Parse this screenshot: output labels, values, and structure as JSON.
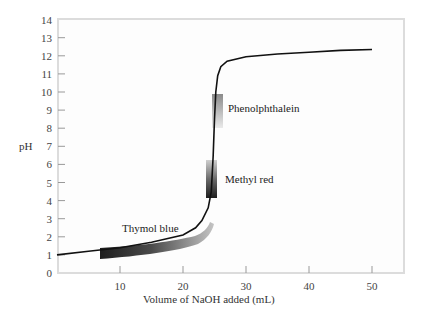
{
  "chart_data": {
    "type": "line",
    "title": "",
    "xlabel": "Volume of NaOH added (mL)",
    "ylabel": "pH",
    "xlim": [
      0,
      55
    ],
    "ylim": [
      0,
      14
    ],
    "xticks": [
      10,
      20,
      30,
      40,
      50
    ],
    "yticks": [
      0,
      1,
      2,
      3,
      4,
      5,
      6,
      7,
      8,
      9,
      10,
      11,
      12,
      13,
      14
    ],
    "grid": false,
    "legend": null,
    "series": [
      {
        "name": "Titration curve",
        "x": [
          0,
          5,
          10,
          15,
          20,
          22,
          23,
          24,
          24.5,
          24.8,
          25,
          25.2,
          25.5,
          26,
          27,
          30,
          35,
          40,
          45,
          50
        ],
        "y": [
          1.0,
          1.2,
          1.4,
          1.7,
          2.1,
          2.5,
          2.9,
          3.6,
          4.5,
          6.5,
          8.5,
          10.0,
          10.9,
          11.4,
          11.7,
          11.95,
          12.1,
          12.2,
          12.3,
          12.35
        ]
      }
    ],
    "annotations": [
      {
        "text": "Thymol blue",
        "indicator_range_x": [
          7,
          24
        ],
        "indicator_range_pH": [
          1.2,
          2.8
        ]
      },
      {
        "text": "Methyl red",
        "indicator_range_x": [
          24,
          25.5
        ],
        "indicator_range_pH": [
          4.2,
          6.3
        ]
      },
      {
        "text": "Phenolphthalein",
        "indicator_range_x": [
          25,
          26.5
        ],
        "indicator_range_pH": [
          8.2,
          10.0
        ]
      }
    ]
  },
  "labels": {
    "xlabel": "Volume of NaOH added (mL)",
    "ylabel": "pH",
    "thymol": "Thymol blue",
    "methyl": "Methyl red",
    "phenol": "Phenolphthalein"
  },
  "colors": {
    "curve": "#111111",
    "frame": "#d9d9d9",
    "band_dark": "#222222",
    "band_light": "#bbbbbb"
  }
}
